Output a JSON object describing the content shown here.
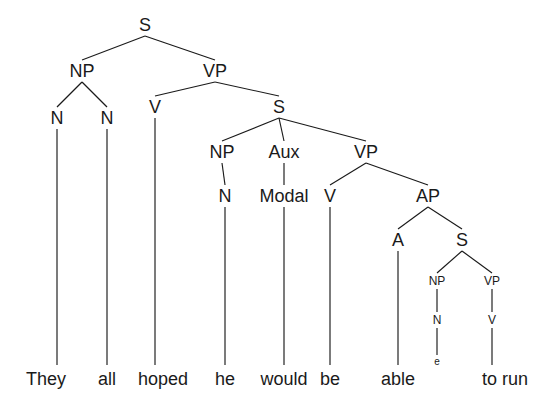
{
  "figure": {
    "kind": "syntax-tree",
    "sentence": "They all hoped he would be able e to run",
    "line_color": "#1a1a1a",
    "text_color": "#1a1a1a",
    "background_color": "#ffffff"
  },
  "nodes": [
    {
      "id": "s-root",
      "label": "S",
      "x": 145,
      "y": 25,
      "size": "normal"
    },
    {
      "id": "np-1",
      "label": "NP",
      "x": 82,
      "y": 71,
      "size": "normal"
    },
    {
      "id": "vp-1",
      "label": "VP",
      "x": 215,
      "y": 71,
      "size": "normal"
    },
    {
      "id": "n-they",
      "label": "N",
      "x": 57,
      "y": 118,
      "size": "normal"
    },
    {
      "id": "n-all",
      "label": "N",
      "x": 107,
      "y": 118,
      "size": "normal"
    },
    {
      "id": "v-hoped",
      "label": "V",
      "x": 155,
      "y": 107,
      "size": "normal"
    },
    {
      "id": "s-embedded",
      "label": "S",
      "x": 279,
      "y": 107,
      "size": "normal"
    },
    {
      "id": "np-2",
      "label": "NP",
      "x": 222,
      "y": 152,
      "size": "normal"
    },
    {
      "id": "aux-1",
      "label": "Aux",
      "x": 284,
      "y": 152,
      "size": "normal"
    },
    {
      "id": "vp-2",
      "label": "VP",
      "x": 366,
      "y": 152,
      "size": "normal"
    },
    {
      "id": "n-he",
      "label": "N",
      "x": 225,
      "y": 196,
      "size": "normal"
    },
    {
      "id": "modal-would",
      "label": "Modal",
      "x": 284,
      "y": 196,
      "size": "normal"
    },
    {
      "id": "v-be",
      "label": "V",
      "x": 330,
      "y": 196,
      "size": "normal"
    },
    {
      "id": "ap-1",
      "label": "AP",
      "x": 428,
      "y": 196,
      "size": "normal"
    },
    {
      "id": "a-able",
      "label": "A",
      "x": 398,
      "y": 240,
      "size": "normal"
    },
    {
      "id": "s-small",
      "label": "S",
      "x": 462,
      "y": 240,
      "size": "normal"
    },
    {
      "id": "np-3",
      "label": "NP",
      "x": 437,
      "y": 281,
      "size": "small"
    },
    {
      "id": "vp-3",
      "label": "VP",
      "x": 492,
      "y": 281,
      "size": "small"
    },
    {
      "id": "n-trace",
      "label": "N",
      "x": 437,
      "y": 320,
      "size": "small"
    },
    {
      "id": "v-torun",
      "label": "V",
      "x": 492,
      "y": 320,
      "size": "small"
    },
    {
      "id": "e-trace",
      "label": "e",
      "x": 437,
      "y": 362,
      "size": "tiny"
    }
  ],
  "edges": [
    {
      "id": "e-sroot-np1",
      "from": "s-root",
      "to": "np-1"
    },
    {
      "id": "e-sroot-vp1",
      "from": "s-root",
      "to": "vp-1"
    },
    {
      "id": "e-np1-nthey",
      "from": "np-1",
      "to": "n-they"
    },
    {
      "id": "e-np1-nall",
      "from": "np-1",
      "to": "n-all"
    },
    {
      "id": "e-vp1-vhoped",
      "from": "vp-1",
      "to": "v-hoped"
    },
    {
      "id": "e-vp1-semb",
      "from": "vp-1",
      "to": "s-embedded"
    },
    {
      "id": "e-semb-np2",
      "from": "s-embedded",
      "to": "np-2"
    },
    {
      "id": "e-semb-aux",
      "from": "s-embedded",
      "to": "aux-1"
    },
    {
      "id": "e-semb-vp2",
      "from": "s-embedded",
      "to": "vp-2"
    },
    {
      "id": "e-np2-nhe",
      "from": "np-2",
      "to": "n-he"
    },
    {
      "id": "e-aux-modal",
      "from": "aux-1",
      "to": "modal-would"
    },
    {
      "id": "e-vp2-vbe",
      "from": "vp-2",
      "to": "v-be"
    },
    {
      "id": "e-vp2-ap",
      "from": "vp-2",
      "to": "ap-1"
    },
    {
      "id": "e-ap-aable",
      "from": "ap-1",
      "to": "a-able"
    },
    {
      "id": "e-ap-ssmall",
      "from": "ap-1",
      "to": "s-small"
    },
    {
      "id": "e-ssmall-np3",
      "from": "s-small",
      "to": "np-3"
    },
    {
      "id": "e-ssmall-vp3",
      "from": "s-small",
      "to": "vp-3"
    },
    {
      "id": "e-np3-ntrace",
      "from": "np-3",
      "to": "n-trace"
    },
    {
      "id": "e-vp3-vtorun",
      "from": "vp-3",
      "to": "v-torun"
    },
    {
      "id": "e-ntrace-etrace",
      "from": "n-trace",
      "to": "e-trace"
    }
  ],
  "leaves": [
    {
      "id": "word-they",
      "text": "They",
      "x": 46,
      "y": 379,
      "stem_from": "n-they"
    },
    {
      "id": "word-all",
      "text": "all",
      "x": 107,
      "y": 379,
      "stem_from": "n-all"
    },
    {
      "id": "word-hoped",
      "text": "hoped",
      "x": 163,
      "y": 379,
      "stem_from": "v-hoped"
    },
    {
      "id": "word-he",
      "text": "he",
      "x": 225,
      "y": 379,
      "stem_from": "n-he"
    },
    {
      "id": "word-would",
      "text": "would",
      "x": 284,
      "y": 379,
      "stem_from": "modal-would"
    },
    {
      "id": "word-be",
      "text": "be",
      "x": 330,
      "y": 379,
      "stem_from": "v-be"
    },
    {
      "id": "word-able",
      "text": "able",
      "x": 398,
      "y": 379,
      "stem_from": "a-able"
    },
    {
      "id": "word-torun",
      "text": "to run",
      "x": 505,
      "y": 379,
      "stem_from": "v-torun"
    }
  ]
}
